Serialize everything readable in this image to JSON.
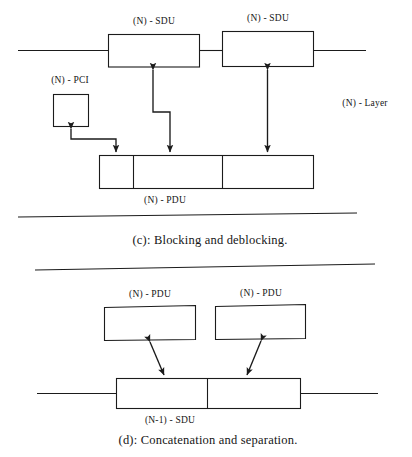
{
  "figure": {
    "ink_color": "#1b1b1b",
    "background": "#ffffff"
  },
  "panel_c": {
    "id": "c",
    "caption": "(c):  Blocking and deblocking.",
    "layer_label": "(N) - Layer",
    "labels": {
      "sdu_left": "(N) - SDU",
      "sdu_right": "(N) - SDU",
      "pci": "(N) - PCI",
      "pdu": "(N) - PDU"
    },
    "boxes": [
      {
        "name": "sdu-left-box",
        "label": "(N) - SDU"
      },
      {
        "name": "sdu-right-box",
        "label": "(N) - SDU"
      },
      {
        "name": "pci-box",
        "label": "(N) - PCI"
      },
      {
        "name": "pdu-bar",
        "label": "(N) - PDU",
        "segments": 3
      }
    ],
    "arrows": [
      {
        "name": "pdu-to-pci-arrow",
        "style": "elbow",
        "heads": "both"
      },
      {
        "name": "pdu-to-sdu-left-arrow",
        "style": "elbow",
        "heads": "both"
      },
      {
        "name": "pdu-to-sdu-right-arrow",
        "style": "vertical",
        "heads": "both"
      }
    ]
  },
  "panel_d": {
    "id": "d",
    "caption": "(d):  Concatenation and separation.",
    "labels": {
      "pdu_left": "(N) - PDU",
      "pdu_right": "(N) - PDU",
      "sdu": "(N-1) - SDU"
    },
    "boxes": [
      {
        "name": "pdu-left-box",
        "label": "(N) - PDU"
      },
      {
        "name": "pdu-right-box",
        "label": "(N) - PDU"
      },
      {
        "name": "sdu-bar",
        "label": "(N-1) - SDU",
        "segments": 2
      }
    ],
    "arrows": [
      {
        "name": "pdu-left-mapping-arrow",
        "style": "diagonal",
        "heads": "both"
      },
      {
        "name": "pdu-right-mapping-arrow",
        "style": "diagonal",
        "heads": "both"
      }
    ]
  }
}
